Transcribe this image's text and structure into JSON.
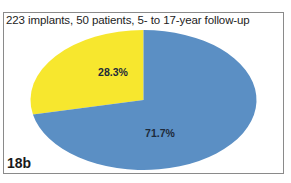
{
  "figure": {
    "label": "18b",
    "title": "223 implants, 50 patients, 5- to 17-year follow-up"
  },
  "chart_data": {
    "type": "pie",
    "title": "223 implants, 50 patients, 5- to 17-year follow-up",
    "categories": [
      "Yellow segment",
      "Blue segment"
    ],
    "values": [
      28.3,
      71.7
    ],
    "labels": [
      "28.3%",
      "71.7%"
    ],
    "colors": [
      "#F7E72E",
      "#5B8FC4"
    ],
    "start_angle_deg": 90,
    "direction": "counterclockwise",
    "legend": "none",
    "figure_label": "18b"
  }
}
